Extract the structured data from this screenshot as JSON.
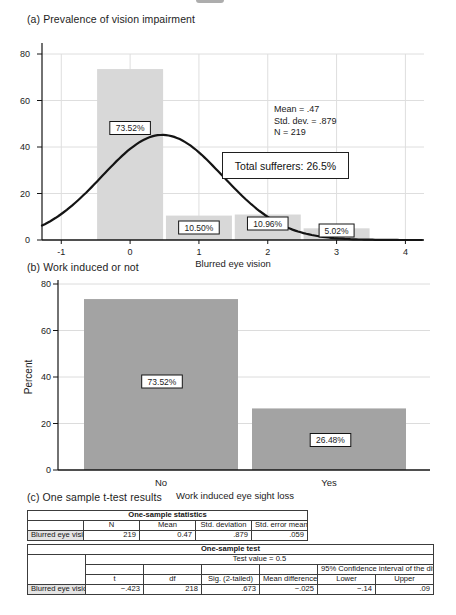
{
  "panels": {
    "a": {
      "title": "(a) Prevalence of vision impairment",
      "stats_lines": [
        "Mean = .47",
        "Std. dev. = .879",
        "N = 219"
      ],
      "callout": "Total sufferers: 26.5%"
    },
    "b": {
      "title": "(b) Work induced or not"
    },
    "c": {
      "title": "(c) One sample t-test results",
      "stats_table": {
        "title": "One-sample statistics",
        "columns": [
          "N",
          "Mean",
          "Std. deviation",
          "Std. error mean"
        ],
        "row_label": "Blurred eye vision",
        "values": [
          "219",
          "0.47",
          ".879",
          ".059"
        ]
      },
      "test_table": {
        "title": "One-sample test",
        "test_value": "Test value = 0.5",
        "ci_header": "95% Confidence interval of the difference",
        "columns": [
          "t",
          "df",
          "Sig. (2-tailed)",
          "Mean difference",
          "Lower",
          "Upper"
        ],
        "row_label": "Blurred eye vision",
        "values": [
          "−.423",
          "218",
          ".673",
          "−.025",
          "−.14",
          ".09"
        ]
      }
    }
  },
  "chart_data": [
    {
      "id": "vision-impairment-histogram",
      "type": "bar",
      "title": "(a) Prevalence of vision impairment",
      "xlabel": "Blurred eye vision",
      "ylabel": "",
      "x": [
        0,
        1,
        2,
        3
      ],
      "values": [
        73.52,
        10.5,
        10.96,
        5.02
      ],
      "bar_labels": [
        "73.52%",
        "10.50%",
        "10.96%",
        "5.02%"
      ],
      "xticks": [
        -1,
        0,
        1,
        2,
        3,
        4
      ],
      "yticks": [
        0,
        20,
        40,
        60,
        80
      ],
      "xlim": [
        -1.28,
        4.27
      ],
      "ylim": [
        0,
        80
      ],
      "grid": true,
      "bar_color": "#d8d8d8",
      "curve": {
        "type": "normal",
        "mean": 0.47,
        "sd": 0.879,
        "peak_height": 45.2
      },
      "annotations": {
        "stats": [
          "Mean = .47",
          "Std. dev. = .879",
          "N = 219"
        ],
        "callout": "Total sufferers: 26.5%"
      }
    },
    {
      "id": "work-induced-bar",
      "type": "bar",
      "title": "(b) Work induced or not",
      "xlabel": "Work induced eye sight loss",
      "ylabel": "Percent",
      "categories": [
        "No",
        "Yes"
      ],
      "values": [
        73.52,
        26.48
      ],
      "bar_labels": [
        "73.52%",
        "26.48%"
      ],
      "yticks": [
        0,
        20,
        40,
        60,
        80
      ],
      "ylim": [
        0,
        80
      ],
      "grid": true,
      "bar_color": "#a3a3a3"
    },
    {
      "id": "one-sample-statistics",
      "type": "table",
      "title": "One-sample statistics",
      "columns": [
        "",
        "N",
        "Mean",
        "Std. deviation",
        "Std. error mean"
      ],
      "rows": [
        [
          "Blurred eye vision",
          "219",
          "0.47",
          ".879",
          ".059"
        ]
      ]
    },
    {
      "id": "one-sample-test",
      "type": "table",
      "title": "One-sample test",
      "subtitle": "Test value = 0.5",
      "columns": [
        "",
        "t",
        "df",
        "Sig. (2-tailed)",
        "Mean difference",
        "95% CI of the difference: Lower",
        "95% CI of the difference: Upper"
      ],
      "rows": [
        [
          "Blurred eye vision",
          "−.423",
          "218",
          ".673",
          "−.025",
          "−.14",
          ".09"
        ]
      ]
    }
  ]
}
